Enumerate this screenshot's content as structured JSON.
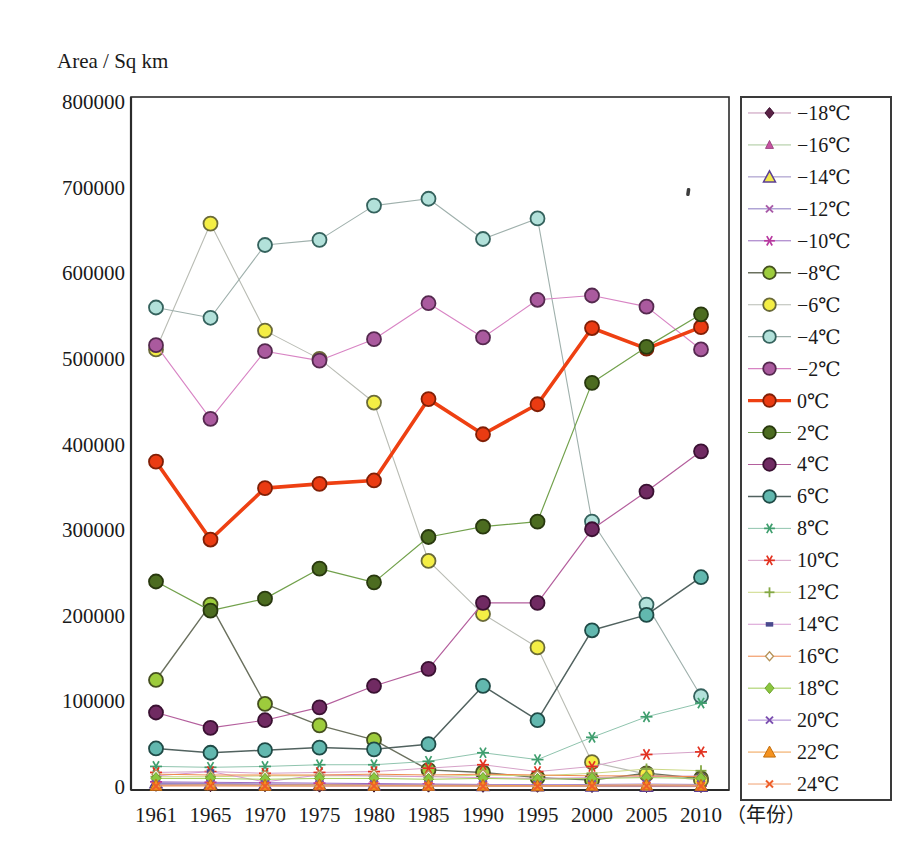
{
  "title": "Area / Sq km",
  "x_axis_unit_label": "（年份）",
  "chart_data": {
    "type": "line",
    "title": "Area / Sq km",
    "ylabel": "Area / Sq km",
    "xlabel": "（年份）",
    "x": [
      1961,
      1965,
      1970,
      1975,
      1980,
      1985,
      1990,
      1995,
      2000,
      2005,
      2010
    ],
    "ylim": [
      0,
      800000
    ],
    "yticks": [
      0,
      100000,
      200000,
      300000,
      400000,
      500000,
      600000,
      700000,
      800000
    ],
    "grid": false,
    "legend_position": "right-outside",
    "series": [
      {
        "name": "−18℃",
        "marker": "diamond",
        "marker_color": "#5a2145",
        "marker_stroke": "#3a1030",
        "line_color": "#c493b6",
        "line_width": 1,
        "values": [
          2000,
          1500,
          1500,
          1000,
          1000,
          1000,
          800,
          800,
          500,
          500,
          500
        ]
      },
      {
        "name": "−16℃",
        "marker": "small-triangle",
        "marker_color": "#c653a1",
        "marker_stroke": "#8d3672",
        "line_color": "#a8c79a",
        "line_width": 1,
        "values": [
          3000,
          2500,
          2000,
          2000,
          1500,
          1500,
          1200,
          1000,
          800,
          600,
          500
        ]
      },
      {
        "name": "−14℃",
        "marker": "open-triangle",
        "marker_color": "#f2e84c",
        "marker_stroke": "#5b3f93",
        "line_color": "#9a8cc4",
        "line_width": 1,
        "values": [
          5000,
          4000,
          3500,
          3000,
          2500,
          2000,
          1800,
          1500,
          1200,
          1000,
          800
        ]
      },
      {
        "name": "−12℃",
        "marker": "x",
        "marker_color": "#a85aa8",
        "marker_stroke": "#a85aa8",
        "line_color": "#8878c0",
        "line_width": 1,
        "values": [
          4000,
          3500,
          3000,
          2800,
          2500,
          2000,
          1500,
          1200,
          1000,
          800,
          600
        ]
      },
      {
        "name": "−10℃",
        "marker": "asterisk",
        "marker_color": "#b8389f",
        "marker_stroke": "#b8389f",
        "line_color": "#9a6cc0",
        "line_width": 1,
        "values": [
          6000,
          5500,
          5000,
          4500,
          4000,
          3500,
          3000,
          2500,
          2000,
          1500,
          1200
        ]
      },
      {
        "name": "−8℃",
        "marker": "circle",
        "marker_color": "#9dcc3c",
        "marker_stroke": "#45501f",
        "line_color": "#6a705e",
        "line_width": 1.4,
        "values": [
          125000,
          213000,
          97000,
          72000,
          55000,
          20000,
          17000,
          11000,
          8000,
          16000,
          10000
        ]
      },
      {
        "name": "−6℃",
        "marker": "circle",
        "marker_color": "#f4ee45",
        "marker_stroke": "#6a6a38",
        "line_color": "#b9bcb4",
        "line_width": 1.1,
        "values": [
          511000,
          658000,
          533000,
          500000,
          449000,
          264000,
          202000,
          163000,
          29000,
          15000,
          8000
        ]
      },
      {
        "name": "−4℃",
        "marker": "circle",
        "marker_color": "#b2e1da",
        "marker_stroke": "#35625d",
        "line_color": "#9fb0ac",
        "line_width": 1.1,
        "values": [
          560000,
          548000,
          633000,
          639000,
          679000,
          687000,
          640000,
          664000,
          310000,
          213000,
          106000
        ]
      },
      {
        "name": "−2℃",
        "marker": "circle",
        "marker_color": "#aa5a9e",
        "marker_stroke": "#55294f",
        "line_color": "#d884c4",
        "line_width": 1.1,
        "values": [
          516000,
          430000,
          509000,
          498000,
          523000,
          565000,
          525000,
          569000,
          574000,
          561000,
          511000
        ]
      },
      {
        "name": "0℃",
        "marker": "circle",
        "marker_color": "#ea3b12",
        "marker_stroke": "#801f06",
        "line_color": "#ee4012",
        "line_width": 3.6,
        "values": [
          380000,
          289000,
          349000,
          354000,
          358000,
          453000,
          412000,
          447000,
          536000,
          512000,
          537000
        ]
      },
      {
        "name": "2℃",
        "marker": "circle",
        "marker_color": "#4c6c20",
        "marker_stroke": "#28380e",
        "line_color": "#72a14c",
        "line_width": 1.2,
        "values": [
          240000,
          206000,
          220000,
          255000,
          239000,
          292000,
          304000,
          310000,
          472000,
          514000,
          552000
        ]
      },
      {
        "name": "4℃",
        "marker": "circle",
        "marker_color": "#702a62",
        "marker_stroke": "#3a1132",
        "line_color": "#b45f9d",
        "line_width": 1.2,
        "values": [
          87000,
          69000,
          78000,
          93000,
          118000,
          138000,
          215000,
          215000,
          301000,
          345000,
          392000
        ]
      },
      {
        "name": "6℃",
        "marker": "circle",
        "marker_color": "#62b8af",
        "marker_stroke": "#1f4a46",
        "line_color": "#51625f",
        "line_width": 1.5,
        "values": [
          45000,
          40000,
          43000,
          46000,
          44000,
          50000,
          118000,
          78000,
          183000,
          201000,
          245000
        ]
      },
      {
        "name": "8℃",
        "marker": "asterisk",
        "marker_color": "#3f9e6e",
        "marker_stroke": "#3f9e6e",
        "line_color": "#8fc4ae",
        "line_width": 1,
        "values": [
          24000,
          23000,
          24000,
          26000,
          26000,
          30000,
          40000,
          32000,
          58000,
          82000,
          98000
        ]
      },
      {
        "name": "10℃",
        "marker": "asterisk",
        "marker_color": "#e23220",
        "marker_stroke": "#e23220",
        "line_color": "#d6a2c8",
        "line_width": 1,
        "values": [
          17000,
          18000,
          16000,
          17000,
          18000,
          22000,
          26000,
          18000,
          24000,
          38000,
          41000
        ]
      },
      {
        "name": "12℃",
        "marker": "plus",
        "marker_color": "#84a844",
        "marker_stroke": "#84a844",
        "line_color": "#ccd985",
        "line_width": 1,
        "values": [
          12000,
          12000,
          13000,
          13000,
          13000,
          12000,
          14000,
          13000,
          16000,
          21000,
          19000
        ]
      },
      {
        "name": "14℃",
        "marker": "dash",
        "marker_color": "#4a4a8e",
        "marker_stroke": "#4a4a8e",
        "line_color": "#d79ad2",
        "line_width": 1,
        "values": [
          13000,
          18000,
          6000,
          14000,
          13000,
          12000,
          11000,
          10000,
          11000,
          12000,
          13000
        ]
      },
      {
        "name": "16℃",
        "marker": "open-diamond",
        "marker_color": "#ffffff",
        "marker_stroke": "#b5935a",
        "line_color": "#f08a4b",
        "line_width": 1,
        "values": [
          15000,
          14000,
          14000,
          14000,
          15000,
          14000,
          15000,
          14000,
          13000,
          13000,
          12000
        ]
      },
      {
        "name": "18℃",
        "marker": "diamond",
        "marker_color": "#8bc63f",
        "marker_stroke": "#6da32c",
        "line_color": "#a0cc58",
        "line_width": 1,
        "values": [
          10000,
          10000,
          9000,
          10000,
          10000,
          9000,
          10000,
          9000,
          10000,
          11000,
          10000
        ]
      },
      {
        "name": "20℃",
        "marker": "x",
        "marker_color": "#7b4fb0",
        "marker_stroke": "#7b4fb0",
        "line_color": "#a887d2",
        "line_width": 1,
        "values": [
          3000,
          3500,
          3000,
          3000,
          3000,
          2500,
          3000,
          2500,
          3000,
          3500,
          3000
        ]
      },
      {
        "name": "22℃",
        "marker": "triangle",
        "marker_color": "#f5921e",
        "marker_stroke": "#c26e0d",
        "line_color": "#f0a050",
        "line_width": 1,
        "values": [
          2000,
          2500,
          2000,
          2500,
          2000,
          2000,
          2000,
          1500,
          2000,
          2500,
          2000
        ]
      },
      {
        "name": "24℃",
        "marker": "x",
        "marker_color": "#ee5f2a",
        "marker_stroke": "#ee5f2a",
        "line_color": "#f0a071",
        "line_width": 1,
        "values": [
          1000,
          1200,
          1000,
          1000,
          1200,
          1000,
          800,
          800,
          1000,
          1200,
          1000
        ]
      }
    ],
    "annotations": [
      {
        "type": "speck",
        "x_px": 688,
        "y_px": 192
      }
    ]
  }
}
